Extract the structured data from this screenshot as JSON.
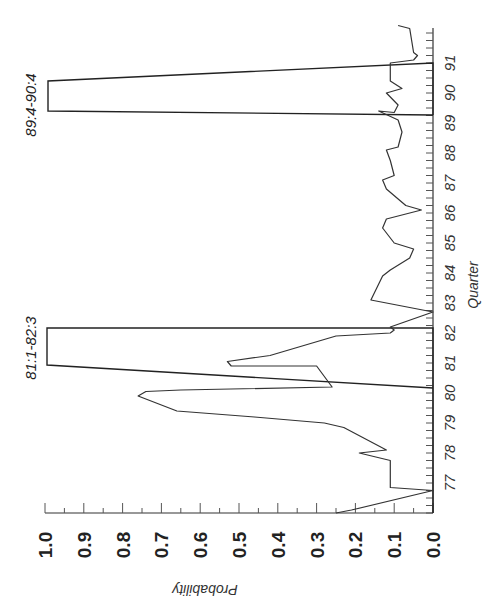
{
  "chart_data": {
    "type": "line",
    "orientation": "rotated-90",
    "title": "",
    "xlabel": "Quarter",
    "ylabel": "Probability",
    "ylim": [
      0.0,
      1.0
    ],
    "xlim": [
      76,
      92
    ],
    "y_ticks": [
      "1.0",
      "0.9",
      "0.8",
      "0.7",
      "0.6",
      "0.5",
      "0.4",
      "0.3",
      "0.2",
      "0.1",
      "0.0"
    ],
    "x_ticks": [
      "77",
      "78",
      "79",
      "80",
      "81",
      "82",
      "83",
      "84",
      "85",
      "86",
      "87",
      "88",
      "89",
      "90",
      "91"
    ],
    "series": [
      {
        "name": "Probability",
        "points": [
          [
            76.0,
            0.25
          ],
          [
            76.1,
            0.21
          ],
          [
            76.75,
            0.0
          ],
          [
            76.85,
            0.11
          ],
          [
            77.75,
            0.11
          ],
          [
            78.0,
            0.19
          ],
          [
            78.1,
            0.12
          ],
          [
            78.85,
            0.23
          ],
          [
            79.0,
            0.28
          ],
          [
            79.2,
            0.46
          ],
          [
            79.4,
            0.66
          ],
          [
            79.9,
            0.76
          ],
          [
            80.05,
            0.74
          ],
          [
            80.1,
            0.65
          ],
          [
            80.2,
            0.26
          ],
          [
            80.9,
            0.3
          ],
          [
            80.9,
            0.52
          ],
          [
            81.05,
            0.53
          ],
          [
            81.25,
            0.42
          ],
          [
            81.9,
            0.25
          ],
          [
            82.0,
            0.11
          ],
          [
            82.1,
            0.1
          ],
          [
            82.2,
            0.11
          ],
          [
            82.7,
            0.0
          ],
          [
            83.1,
            0.16
          ],
          [
            83.9,
            0.13
          ],
          [
            84.1,
            0.11
          ],
          [
            84.5,
            0.06
          ],
          [
            84.8,
            0.05
          ],
          [
            85.0,
            0.1
          ],
          [
            85.5,
            0.13
          ],
          [
            85.8,
            0.12
          ],
          [
            86.1,
            0.03
          ],
          [
            86.25,
            0.07
          ],
          [
            86.8,
            0.12
          ],
          [
            87.1,
            0.13
          ],
          [
            87.25,
            0.1
          ],
          [
            87.75,
            0.11
          ],
          [
            88.1,
            0.12
          ],
          [
            88.2,
            0.09
          ],
          [
            88.7,
            0.08
          ],
          [
            89.1,
            0.09
          ],
          [
            89.4,
            0.14
          ],
          [
            89.35,
            0.1
          ],
          [
            89.6,
            0.09
          ],
          [
            90.0,
            0.12
          ],
          [
            90.15,
            0.08
          ],
          [
            90.4,
            0.11
          ],
          [
            91.0,
            0.11
          ],
          [
            91.1,
            0.05
          ],
          [
            91.25,
            0.04
          ],
          [
            91.35,
            0.05
          ],
          [
            92.15,
            0.06
          ],
          [
            92.25,
            0.09
          ]
        ]
      }
    ],
    "annotations": [
      {
        "label": "81:1-82:3",
        "x_start": 80.2,
        "x_end": 82.0,
        "value": 1.0
      },
      {
        "label": "89:4-90:4",
        "x_start": 89.2,
        "x_end": 90.9,
        "value": 1.0
      }
    ],
    "grid": false,
    "legend": null
  },
  "labels": {
    "ylabel": "Probability",
    "xlabel": "Quarter",
    "ann1": "81:1-82:3",
    "ann2": "89:4-90:4"
  }
}
